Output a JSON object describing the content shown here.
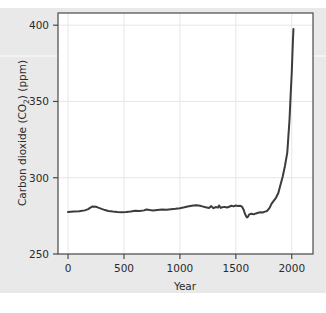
{
  "figure": {
    "background_color": "#e9e9e9",
    "plot_background_color": "#ffffff",
    "frame_color": "#4a4a4a",
    "grid_color": "#e4e4e4",
    "line_color": "#3c3c3c"
  },
  "axes": {
    "xlabel": "Year",
    "ylabel_main": "Carbon dioxide (CO",
    "ylabel_sub": "2",
    "ylabel_tail": ") (ppm)",
    "ylabel_full": "Carbon dioxide (CO2) (ppm)",
    "xticks": [
      "0",
      "500",
      "1000",
      "1500",
      "2000"
    ],
    "yticks": [
      "250",
      "300",
      "350",
      "400"
    ]
  },
  "chart_data": {
    "type": "line",
    "title": "",
    "xlabel": "Year",
    "ylabel": "Carbon dioxide (CO2) (ppm)",
    "xlim": [
      -90,
      2190
    ],
    "ylim": [
      250,
      408
    ],
    "xticks": [
      0,
      500,
      1000,
      1500,
      2000
    ],
    "yticks": [
      250,
      300,
      350,
      400
    ],
    "grid": true,
    "legend": "none",
    "series": [
      {
        "name": "Atmospheric CO2 concentration",
        "color": "#3c3c3c",
        "x": [
          0,
          50,
          100,
          150,
          180,
          200,
          220,
          250,
          270,
          300,
          330,
          360,
          400,
          440,
          480,
          520,
          560,
          600,
          640,
          680,
          700,
          730,
          760,
          800,
          840,
          880,
          920,
          960,
          1000,
          1040,
          1080,
          1120,
          1150,
          1180,
          1200,
          1230,
          1260,
          1280,
          1300,
          1320,
          1340,
          1350,
          1365,
          1380,
          1400,
          1420,
          1440,
          1460,
          1480,
          1500,
          1520,
          1540,
          1555,
          1570,
          1580,
          1590,
          1600,
          1610,
          1620,
          1640,
          1660,
          1680,
          1700,
          1720,
          1740,
          1760,
          1780,
          1800,
          1820,
          1840,
          1860,
          1880,
          1900,
          1920,
          1940,
          1960,
          1980,
          1990,
          2000,
          2010,
          2015
        ],
        "y": [
          277.5,
          277.8,
          278.0,
          278.6,
          279.4,
          280.4,
          281.2,
          281.0,
          280.4,
          279.6,
          278.8,
          278.2,
          277.8,
          277.5,
          277.4,
          277.6,
          277.9,
          278.4,
          278.2,
          278.6,
          279.2,
          278.8,
          278.5,
          278.9,
          279.2,
          279.0,
          279.3,
          279.6,
          280.0,
          280.6,
          281.3,
          281.8,
          282.0,
          281.6,
          281.2,
          280.6,
          280.2,
          281.4,
          280.0,
          280.8,
          280.4,
          281.8,
          280.2,
          280.7,
          280.9,
          280.5,
          281.0,
          281.6,
          281.2,
          281.8,
          281.4,
          281.6,
          281.0,
          279.0,
          276.8,
          275.0,
          274.0,
          274.6,
          276.0,
          276.4,
          276.0,
          276.6,
          277.0,
          277.4,
          277.2,
          277.8,
          278.2,
          280.0,
          283.0,
          285.0,
          287.0,
          290.0,
          295.5,
          301.0,
          308.0,
          316.5,
          338.0,
          354.0,
          369.0,
          389.0,
          397.5
        ]
      }
    ],
    "annotations": []
  }
}
